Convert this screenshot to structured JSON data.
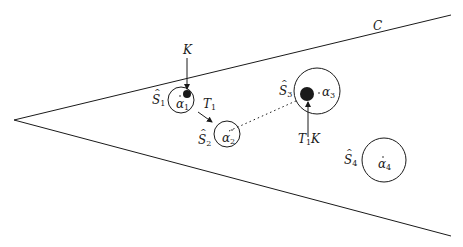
{
  "diagram": {
    "type": "cone-with-balls",
    "cone": {
      "label": "C",
      "apex": [
        14,
        120
      ],
      "upper_end": [
        451,
        15
      ],
      "lower_end": [
        451,
        236
      ]
    },
    "balls": [
      {
        "id": "S1",
        "label": "S",
        "sub": "1",
        "center": [
          181,
          100
        ],
        "r": 13,
        "point_label": "α",
        "point_sub": "1"
      },
      {
        "id": "S2",
        "label": "S",
        "sub": "2",
        "center": [
          227,
          134
        ],
        "r": 13,
        "point_label": "α",
        "point_sub": "2"
      },
      {
        "id": "S3",
        "label": "S",
        "sub": "3",
        "center": [
          317,
          91
        ],
        "r": 23,
        "point_label": "α",
        "point_sub": "3"
      },
      {
        "id": "S4",
        "label": "S",
        "sub": "4",
        "center": [
          384,
          160
        ],
        "r": 22,
        "point_label": "α",
        "point_sub": "4"
      }
    ],
    "sets": [
      {
        "id": "K",
        "label": "K",
        "center": [
          187,
          94
        ],
        "r": 4
      },
      {
        "id": "T1K",
        "label": "T",
        "sub": "1",
        "suffix": "K",
        "center": [
          307,
          94
        ],
        "r": 7
      }
    ],
    "map": {
      "label": "T",
      "sub": "1"
    },
    "colors": {
      "ink": "#1a1a1a",
      "background": "#ffffff"
    }
  }
}
